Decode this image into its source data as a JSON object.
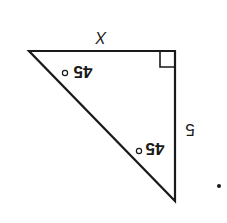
{
  "figure": {
    "type": "right-triangle",
    "orientation": "rotated 180 degrees",
    "side_labels": {
      "top": "X",
      "right": "5"
    },
    "angle_labels": {
      "top_left": "45",
      "bottom": "45",
      "degree_symbol": "°"
    },
    "right_angle_marker": true,
    "stroke_color": "#1a1a1a",
    "background": "#ffffff"
  }
}
